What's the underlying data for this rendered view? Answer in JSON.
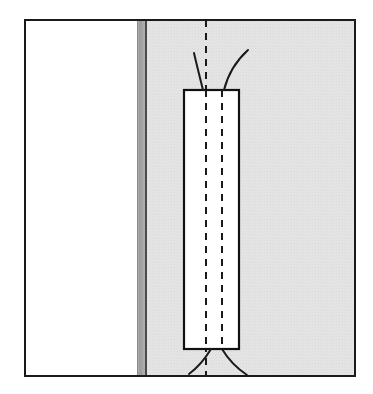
{
  "figure": {
    "title": "Technical line diagram",
    "description": "Rectangular outline element superimposed on a shaded field bounded at left by a dark vertical band, with two dashed vertical centerlines and curved lead lines emerging from the top and bottom of the rectangle.",
    "type": "line-drawing",
    "image_width": 373,
    "image_height": 394,
    "background_color": "#ffffff"
  },
  "colors": {
    "page_background": "#ffffff",
    "frame_stroke": "#1a1a1a",
    "shaded_field": "#e4e4e4",
    "shaded_field_edge": "#dcdcdc",
    "dark_band": "#9a9a9a",
    "dark_band_line": "#4a4a4a",
    "white_panel": "#ffffff",
    "rect_stroke": "#111111",
    "dashed_stroke": "#1a1a1a",
    "whisker_stroke": "#1a1a1a"
  },
  "frame": {
    "name": "outer-frame",
    "x": 24,
    "y": 19,
    "width": 332,
    "height": 358,
    "stroke_width": 2
  },
  "left_white_region": {
    "name": "left-white-region",
    "x": 25,
    "y": 20,
    "width": 112,
    "height": 356,
    "fill": "#ffffff"
  },
  "dark_band": {
    "name": "vertical-dark-band",
    "x": 137,
    "y": 20,
    "width": 8,
    "height": 356,
    "fill": "#9a9a9a",
    "inner_line_x": 145,
    "inner_line_width": 2
  },
  "shaded_field": {
    "name": "shaded-field",
    "x": 147,
    "y": 20,
    "width": 208,
    "height": 356,
    "fill": "#e4e4e4"
  },
  "rectangle": {
    "name": "central-rectangle",
    "x": 184,
    "y": 90,
    "width": 55,
    "height": 259,
    "fill": "#ffffff",
    "stroke_width": 2.2
  },
  "dashed_lines": [
    {
      "name": "dashed-centerline-left",
      "x": 206,
      "y1": 20,
      "y2": 376,
      "dash": "7 6",
      "stroke_width": 2
    },
    {
      "name": "dashed-centerline-right",
      "x": 222,
      "y1": 90,
      "y2": 349,
      "dash": "7 6",
      "stroke_width": 2
    }
  ],
  "whiskers": {
    "top": [
      {
        "name": "whisker-top-left",
        "path": "M 203 90 C 199 74 196 62 194 53",
        "stroke_width": 2
      },
      {
        "name": "whisker-top-right",
        "path": "M 224 90 C 228 74 237 60 248 50",
        "stroke_width": 2
      }
    ],
    "bottom": [
      {
        "name": "whisker-bottom-left",
        "path": "M 211 349 C 205 359 197 368 189 374",
        "stroke_width": 2
      },
      {
        "name": "whisker-bottom-right",
        "path": "M 222 349 C 228 359 238 369 247 375",
        "stroke_width": 2
      }
    ]
  }
}
